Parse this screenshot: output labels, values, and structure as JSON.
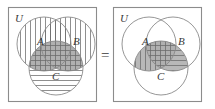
{
  "figure": {
    "type": "venn-diagram-identity",
    "equals_symbol": "=",
    "caption_identity": "(A ∪ B) ∩ C = (A ∩ C) ∪ (B ∩ C)"
  },
  "left_diagram": {
    "universe_label": "U",
    "set_labels": {
      "a": "A",
      "b": "B",
      "c": "C"
    },
    "shading_description": "Circles A and B filled with vertical hatching; circle C filled with horizontal hatching; overlaps appear cross-hatched and gray.",
    "regions": [
      {
        "name": "A",
        "pattern": "vertical"
      },
      {
        "name": "B",
        "pattern": "vertical"
      },
      {
        "name": "C",
        "pattern": "horizontal"
      },
      {
        "name": "A∩B",
        "pattern": "vertical"
      },
      {
        "name": "A∩C",
        "pattern": "cross-gray"
      },
      {
        "name": "B∩C",
        "pattern": "cross-gray"
      },
      {
        "name": "A∩B∩C",
        "pattern": "cross-gray"
      }
    ]
  },
  "right_diagram": {
    "universe_label": "U",
    "set_labels": {
      "a": "A",
      "b": "B",
      "c": "C"
    },
    "shading_description": "Only the overlaps with C are shaded: A∩C vertical hatching on gray, B∩C horizontal hatching on gray, A∩B∩C cross-hatched on gray.",
    "regions": [
      {
        "name": "A∩C",
        "pattern": "vertical-gray"
      },
      {
        "name": "B∩C",
        "pattern": "horizontal-gray"
      },
      {
        "name": "A∩B∩C",
        "pattern": "cross-gray"
      }
    ]
  },
  "colors": {
    "box_stroke": "#8c8c8c",
    "circle_stroke": "#8a8a8a",
    "hatch_stroke": "#6a6a6a",
    "shade_fill": "#b8b8b8",
    "text": "#3a3a3a",
    "background": "#ffffff"
  }
}
